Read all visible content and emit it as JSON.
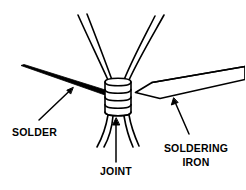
{
  "figure": {
    "background_color": "#ffffff",
    "line_color": "#000000",
    "solder_fill": "#000000",
    "wire_fill": "#ffffff",
    "labels": {
      "solder": "SOLDER",
      "joint": "JOINT",
      "soldering_iron_line1": "SOLDERING",
      "soldering_iron_line2": "IRON"
    },
    "parts": {
      "solder_bar": "solder-bar",
      "soldering_iron": "soldering-iron",
      "wire_joint_coil": "wire-joint-coil",
      "wires_upper": "wires-upper",
      "wires_lower": "wires-lower"
    },
    "leader_lines": {
      "solder_arrow": "arrow pointing up-right to solder bar",
      "joint_arrow": "arrow pointing up to wrapped joint",
      "iron_arrow": "arrow pointing up-left to soldering iron"
    }
  }
}
